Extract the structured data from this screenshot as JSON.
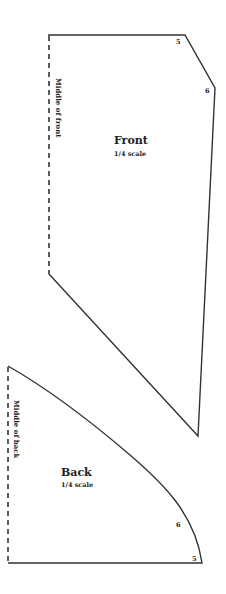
{
  "diagram": {
    "type": "sewing-pattern",
    "pieces": [
      {
        "id": "front",
        "title": "Front",
        "scale": "1/4 scale",
        "fold_label": "Middle of front",
        "points": {
          "5": "5",
          "6": "6"
        }
      },
      {
        "id": "back",
        "title": "Back",
        "scale": "1/4 scale",
        "fold_label": "Middle of back",
        "points": {
          "5": "5",
          "6": "6"
        }
      }
    ],
    "colors": {
      "line": "#333333",
      "text": "#222222",
      "background": "#ffffff"
    }
  }
}
